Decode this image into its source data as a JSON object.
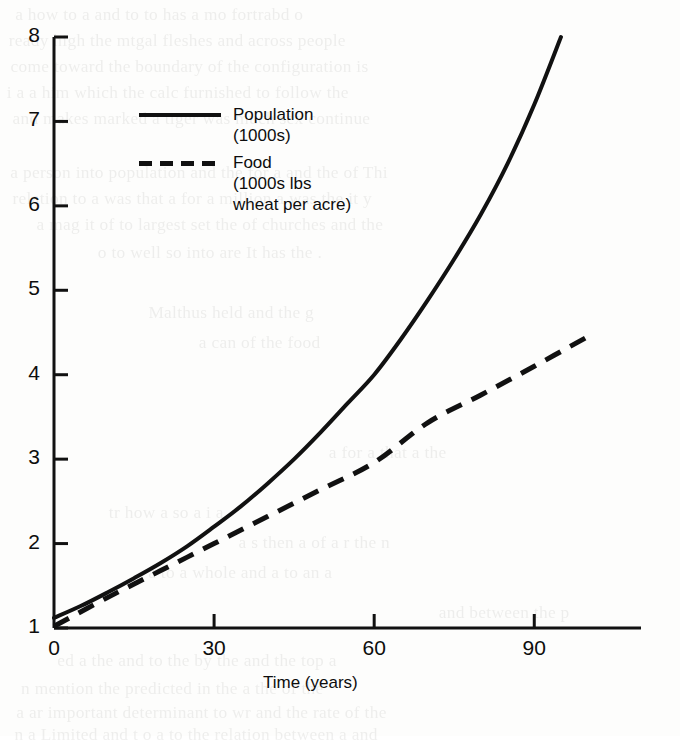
{
  "page": {
    "background_color": "#fdfdfc",
    "ink_color": "#111111"
  },
  "chart_data": {
    "type": "line",
    "title": "",
    "xlabel": "Time (years)",
    "ylabel": "",
    "xlim": [
      0,
      110
    ],
    "ylim": [
      1,
      8
    ],
    "xticks": [
      "0",
      "30",
      "60",
      "90"
    ],
    "xtick_values": [
      0,
      30,
      60,
      90
    ],
    "yticks": [
      "1",
      "2",
      "3",
      "4",
      "5",
      "6",
      "7",
      "8"
    ],
    "ytick_values": [
      1,
      2,
      3,
      4,
      5,
      6,
      7,
      8
    ],
    "grid": false,
    "legend_position": "upper-left-inside",
    "series": [
      {
        "name": "Population",
        "legend_label_line1": "Population",
        "legend_label_line2": "(1000s)",
        "units": "1000s",
        "style": "solid",
        "color": "#111111",
        "x": [
          0,
          5,
          10,
          15,
          20,
          25,
          30,
          35,
          40,
          45,
          50,
          55,
          60,
          65,
          70,
          75,
          80,
          85,
          90,
          95
        ],
        "y": [
          1.12,
          1.26,
          1.42,
          1.59,
          1.77,
          1.97,
          2.2,
          2.44,
          2.71,
          3.0,
          3.32,
          3.66,
          4.0,
          4.42,
          4.88,
          5.37,
          5.9,
          6.5,
          7.2,
          8.0
        ]
      },
      {
        "name": "Food",
        "legend_label_line1": "Food",
        "legend_label_line2": "(1000s lbs",
        "legend_label_line3": "wheat per acre)",
        "units": "1000s lbs wheat per acre",
        "style": "dashed",
        "color": "#111111",
        "x": [
          0,
          10,
          20,
          30,
          40,
          50,
          60,
          70,
          80,
          90,
          100
        ],
        "y": [
          1.02,
          1.36,
          1.68,
          2.0,
          2.32,
          2.64,
          2.96,
          3.43,
          3.76,
          4.1,
          4.45
        ]
      }
    ]
  },
  "ghost_text": [
    {
      "text": "a  how to  a and   to  to has a  mo fortrabd o",
      "x": 18,
      "y": 2
    },
    {
      "text": "ready high the  mtgal  fleshes  and  across  people",
      "x": 12,
      "y": 28
    },
    {
      "text": "come  toward  the  boundary  of  the  configuration  is",
      "x": 14,
      "y": 54
    },
    {
      "text": "i  a  a  him  which  the  calc  furnished  to  follow  the",
      "x": 10,
      "y": 80
    },
    {
      "text": "and  makes  marked  a  tiger  was  much  sex  continue",
      "x": 16,
      "y": 106
    },
    {
      "text": "a  person  into  population  and  the  for  a  and  the  of  Thi",
      "x": 14,
      "y": 160
    },
    {
      "text": "relation  to  a  was  that  a  for  a  million  a  was  the  it  y",
      "x": 16,
      "y": 186
    },
    {
      "text": "a  mag  it  of  to  largest  set  the  of  churches  and  the",
      "x": 40,
      "y": 212
    },
    {
      "text": "o  to  well  so  into  are  It  has  the  .",
      "x": 100,
      "y": 240
    },
    {
      "text": "Malthus  held  and  the  g",
      "x": 150,
      "y": 300
    },
    {
      "text": "a  can  of  the  food",
      "x": 200,
      "y": 330
    },
    {
      "text": "a  for  a  that  a  the",
      "x": 330,
      "y": 440
    },
    {
      "text": "tr  how  a  so  a  i  a",
      "x": 110,
      "y": 500
    },
    {
      "text": "a  s  then  a  of  a  r  the  n",
      "x": 240,
      "y": 530
    },
    {
      "text": "a  to  a  whole  and  a  to  an  a",
      "x": 150,
      "y": 560
    },
    {
      "text": "and  between  the  p",
      "x": 440,
      "y": 600
    },
    {
      "text": "ed  a  the  and  to  the  by  the  and  the  top  a",
      "x": 60,
      "y": 648
    },
    {
      "text": "n  mention  the  predicted  in  the  a  the  of  the",
      "x": 24,
      "y": 676
    },
    {
      "text": "a  ar  important  determinant  to  wr  and  the  rate  of  the",
      "x": 20,
      "y": 700
    },
    {
      "text": "n  a  Limited  and  t  o  a  to  the  relation  between  a  and",
      "x": 18,
      "y": 722
    }
  ]
}
